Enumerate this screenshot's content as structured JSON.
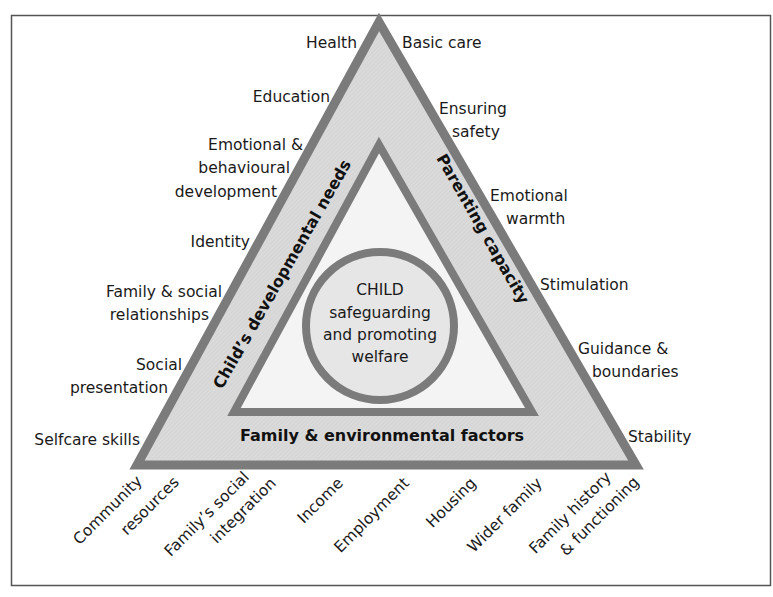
{
  "diagram": {
    "colors": {
      "frame": "#555555",
      "outline": "#7b7b7b",
      "band_fill": "#d9d9d9",
      "inner_fill": "#f3f3f3",
      "text": "#1a1a1a"
    },
    "center": {
      "line1": "CHILD",
      "line2": "safeguarding",
      "line3": "and promoting",
      "line4": "welfare"
    },
    "sides": {
      "left": "Child’s developmental needs",
      "right": "Parenting capacity",
      "bottom": "Family & environmental factors"
    },
    "left_items": [
      {
        "lines": [
          "Health"
        ]
      },
      {
        "lines": [
          "Education"
        ]
      },
      {
        "lines": [
          "Emotional &",
          "behavioural",
          "development"
        ]
      },
      {
        "lines": [
          "Identity"
        ]
      },
      {
        "lines": [
          "Family & social",
          "relationships"
        ]
      },
      {
        "lines": [
          "Social",
          "presentation"
        ]
      },
      {
        "lines": [
          "Selfcare skills"
        ]
      }
    ],
    "right_items": [
      {
        "lines": [
          "Basic care"
        ]
      },
      {
        "lines": [
          "Ensuring",
          "safety"
        ]
      },
      {
        "lines": [
          "Emotional",
          "warmth"
        ]
      },
      {
        "lines": [
          "Stimulation"
        ]
      },
      {
        "lines": [
          "Guidance &",
          "boundaries"
        ]
      },
      {
        "lines": [
          "Stability"
        ]
      }
    ],
    "bottom_items": [
      {
        "lines": [
          "Community",
          "resources"
        ]
      },
      {
        "lines": [
          "Family’s social",
          "integration"
        ]
      },
      {
        "lines": [
          "Income"
        ]
      },
      {
        "lines": [
          "Employment"
        ]
      },
      {
        "lines": [
          "Housing"
        ]
      },
      {
        "lines": [
          "Wider family"
        ]
      },
      {
        "lines": [
          "Family history",
          "& functioning"
        ]
      }
    ]
  }
}
